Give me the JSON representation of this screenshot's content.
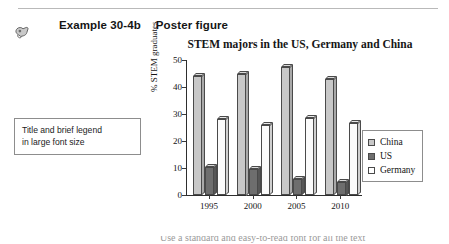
{
  "header": {
    "icon": "pointing-hand-icon",
    "example_label": "Example 30-4b",
    "example_sub": "Poster figure"
  },
  "callout": {
    "line1": "Title and brief legend",
    "line2": "in large font size"
  },
  "legend": {
    "items": [
      {
        "label": "China",
        "color": "#c8c8c8"
      },
      {
        "label": "US",
        "color": "#6e6e6e"
      },
      {
        "label": "Germany",
        "color": "#ffffff"
      }
    ]
  },
  "bottom_caption": "Use a standard and easy-to-read font for all the text",
  "chart_data": {
    "type": "bar",
    "title": "STEM majors in the US, Germany and China",
    "xlabel": "",
    "ylabel": "% STEM graduates",
    "categories": [
      "1995",
      "2000",
      "2005",
      "2010"
    ],
    "yticks": [
      0,
      10,
      20,
      30,
      40,
      50
    ],
    "ylim": [
      0,
      50
    ],
    "grid": false,
    "legend_position": "right",
    "series": [
      {
        "name": "China",
        "color": "#c8c8c8",
        "values": [
          44.0,
          45.0,
          47.5,
          43.0
        ]
      },
      {
        "name": "US",
        "color": "#6e6e6e",
        "values": [
          10.5,
          9.5,
          6.0,
          5.0
        ]
      },
      {
        "name": "Germany",
        "color": "#fbfbfb",
        "values": [
          28.0,
          26.0,
          28.5,
          26.5
        ]
      }
    ]
  }
}
